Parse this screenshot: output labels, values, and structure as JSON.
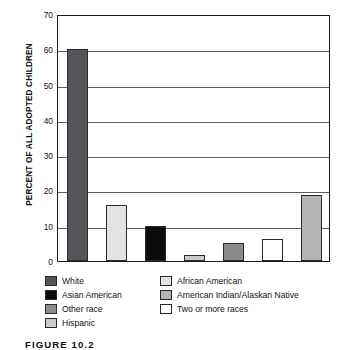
{
  "chart_data": {
    "type": "bar",
    "title": "",
    "xlabel": "",
    "ylabel": "PERCENT OF ALL ADOPTED CHILDREN",
    "ylim": [
      0,
      70
    ],
    "ytick_labels": [
      "70",
      "60",
      "50",
      "40",
      "30",
      "20",
      "10",
      "0"
    ],
    "ytick_values": [
      70,
      60,
      50,
      40,
      30,
      20,
      10,
      0
    ],
    "grid": "horizontal",
    "legend_position": "below-plot",
    "categories": [
      "White",
      "African American",
      "Asian American",
      "Hispanic",
      "Other race",
      "Two or more races",
      "American Indian/Alaskan Native"
    ],
    "values": [
      60,
      16,
      9.9,
      1.7,
      5.2,
      6.3,
      18.6
    ],
    "colors": [
      "#56565a",
      "#e2e2e2",
      "#0b0b0b",
      "#c9c9c9",
      "#8c8c8c",
      "#ffffff",
      "#b4b4b4"
    ]
  },
  "legend": {
    "column1": [
      {
        "label": "White",
        "color": "#56565a"
      },
      {
        "label": "Asian American",
        "color": "#0b0b0b"
      },
      {
        "label": "Other race",
        "color": "#8c8c8c"
      },
      {
        "label": "Hispanic",
        "color": "#c9c9c9"
      }
    ],
    "column2": [
      {
        "label": "African American",
        "color": "#e2e2e2"
      },
      {
        "label": "American Indian/Alaskan Native",
        "color": "#b4b4b4"
      },
      {
        "label": "Two or more races",
        "color": "#ffffff"
      }
    ]
  },
  "caption": {
    "text": "FIGURE 10.2"
  }
}
